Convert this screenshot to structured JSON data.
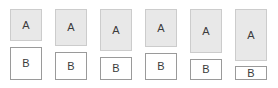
{
  "figure": {
    "background_color": "#ffffff",
    "box_a_fill": "#e8e8e8",
    "box_a_border": "#cccccc",
    "box_b_fill": "#ffffff",
    "box_b_border": "#9a9a9a",
    "text_color": "#3b3b3b"
  },
  "groups": [
    {
      "index": 1,
      "a": {
        "label": "A",
        "x": 10,
        "y": 9,
        "width": 32,
        "height": 32
      },
      "b": {
        "label": "B",
        "x": 10,
        "y": 47,
        "width": 32,
        "height": 33
      }
    },
    {
      "index": 2,
      "a": {
        "label": "A",
        "x": 55,
        "y": 9,
        "width": 32,
        "height": 37
      },
      "b": {
        "label": "B",
        "x": 55,
        "y": 52,
        "width": 32,
        "height": 28
      }
    },
    {
      "index": 3,
      "a": {
        "label": "A",
        "x": 100,
        "y": 9,
        "width": 32,
        "height": 42
      },
      "b": {
        "label": "B",
        "x": 100,
        "y": 57,
        "width": 32,
        "height": 23
      }
    },
    {
      "index": 4,
      "a": {
        "label": "A",
        "x": 145,
        "y": 9,
        "width": 32,
        "height": 38
      },
      "b": {
        "label": "B",
        "x": 145,
        "y": 53,
        "width": 32,
        "height": 27
      }
    },
    {
      "index": 5,
      "a": {
        "label": "A",
        "x": 190,
        "y": 9,
        "width": 32,
        "height": 44
      },
      "b": {
        "label": "B",
        "x": 190,
        "y": 59,
        "width": 32,
        "height": 21
      }
    },
    {
      "index": 6,
      "a": {
        "label": "A",
        "x": 235,
        "y": 9,
        "width": 32,
        "height": 52
      },
      "b": {
        "label": "B",
        "x": 235,
        "y": 66,
        "width": 32,
        "height": 14
      }
    }
  ]
}
